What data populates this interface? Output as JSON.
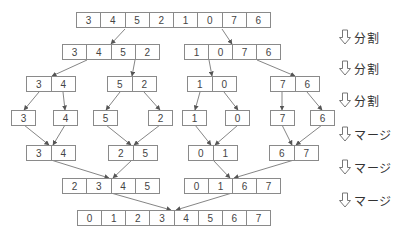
{
  "diagram": {
    "type": "merge-sort",
    "colors": {
      "border": "#8a8a8a",
      "text": "#444444",
      "label": "#333333",
      "arrow": "#666666"
    },
    "rows": [
      {
        "step": "input",
        "arrays": [
          {
            "id": "r0a",
            "x": 76,
            "y": 12,
            "w": 195,
            "values": [
              "3",
              "4",
              "5",
              "2",
              "1",
              "0",
              "7",
              "6"
            ]
          }
        ]
      },
      {
        "step": "split-1",
        "arrays": [
          {
            "id": "r1a",
            "x": 62,
            "y": 44,
            "w": 98,
            "values": [
              "3",
              "4",
              "5",
              "2"
            ]
          },
          {
            "id": "r1b",
            "x": 184,
            "y": 44,
            "w": 97,
            "values": [
              "1",
              "0",
              "7",
              "6"
            ]
          }
        ]
      },
      {
        "step": "split-2",
        "arrays": [
          {
            "id": "r2a",
            "x": 26,
            "y": 76,
            "w": 50,
            "values": [
              "3",
              "4"
            ]
          },
          {
            "id": "r2b",
            "x": 107,
            "y": 76,
            "w": 50,
            "values": [
              "5",
              "2"
            ]
          },
          {
            "id": "r2c",
            "x": 187,
            "y": 76,
            "w": 50,
            "values": [
              "1",
              "0"
            ]
          },
          {
            "id": "r2d",
            "x": 270,
            "y": 76,
            "w": 50,
            "values": [
              "7",
              "6"
            ]
          }
        ]
      },
      {
        "step": "split-3",
        "arrays": [
          {
            "id": "r3a",
            "x": 11,
            "y": 110,
            "w": 25,
            "values": [
              "3"
            ]
          },
          {
            "id": "r3b",
            "x": 53,
            "y": 110,
            "w": 25,
            "values": [
              "4"
            ]
          },
          {
            "id": "r3c",
            "x": 93,
            "y": 110,
            "w": 25,
            "values": [
              "5"
            ]
          },
          {
            "id": "r3d",
            "x": 148,
            "y": 110,
            "w": 25,
            "values": [
              "2"
            ]
          },
          {
            "id": "r3e",
            "x": 182,
            "y": 110,
            "w": 25,
            "values": [
              "1"
            ]
          },
          {
            "id": "r3f",
            "x": 225,
            "y": 110,
            "w": 25,
            "values": [
              "0"
            ]
          },
          {
            "id": "r3g",
            "x": 270,
            "y": 110,
            "w": 25,
            "values": [
              "7"
            ]
          },
          {
            "id": "r3h",
            "x": 310,
            "y": 110,
            "w": 25,
            "values": [
              "6"
            ]
          }
        ]
      },
      {
        "step": "merge-1",
        "arrays": [
          {
            "id": "r4a",
            "x": 26,
            "y": 145,
            "w": 50,
            "values": [
              "3",
              "4"
            ]
          },
          {
            "id": "r4b",
            "x": 108,
            "y": 145,
            "w": 50,
            "values": [
              "2",
              "5"
            ]
          },
          {
            "id": "r4c",
            "x": 188,
            "y": 145,
            "w": 50,
            "values": [
              "0",
              "1"
            ]
          },
          {
            "id": "r4d",
            "x": 269,
            "y": 145,
            "w": 50,
            "values": [
              "6",
              "7"
            ]
          }
        ]
      },
      {
        "step": "merge-2",
        "arrays": [
          {
            "id": "r5a",
            "x": 62,
            "y": 178,
            "w": 98,
            "values": [
              "2",
              "3",
              "4",
              "5"
            ]
          },
          {
            "id": "r5b",
            "x": 184,
            "y": 178,
            "w": 97,
            "values": [
              "0",
              "1",
              "6",
              "7"
            ]
          }
        ]
      },
      {
        "step": "merge-3",
        "arrays": [
          {
            "id": "r6a",
            "x": 77,
            "y": 210,
            "w": 194,
            "values": [
              "0",
              "1",
              "2",
              "3",
              "4",
              "5",
              "6",
              "7"
            ]
          }
        ]
      }
    ],
    "edges": [
      [
        125,
        29,
        111,
        44
      ],
      [
        222,
        29,
        232,
        44
      ],
      [
        87,
        60,
        52,
        76
      ],
      [
        135,
        60,
        132,
        76
      ],
      [
        209,
        60,
        212,
        76
      ],
      [
        257,
        60,
        295,
        76
      ],
      [
        39,
        92,
        24,
        110
      ],
      [
        63,
        92,
        65,
        110
      ],
      [
        120,
        92,
        106,
        110
      ],
      [
        144,
        92,
        160,
        110
      ],
      [
        200,
        92,
        195,
        110
      ],
      [
        224,
        92,
        238,
        110
      ],
      [
        282,
        92,
        282,
        110
      ],
      [
        307,
        92,
        322,
        110
      ],
      [
        24,
        125,
        49,
        145
      ],
      [
        65,
        125,
        53,
        145
      ],
      [
        106,
        125,
        131,
        145
      ],
      [
        160,
        125,
        134,
        145
      ],
      [
        195,
        125,
        211,
        145
      ],
      [
        238,
        125,
        215,
        145
      ],
      [
        282,
        125,
        292,
        145
      ],
      [
        322,
        125,
        296,
        145
      ],
      [
        51,
        160,
        109,
        178
      ],
      [
        132,
        160,
        113,
        178
      ],
      [
        213,
        160,
        230,
        178
      ],
      [
        294,
        160,
        234,
        178
      ],
      [
        111,
        193,
        171,
        210
      ],
      [
        232,
        193,
        176,
        210
      ]
    ],
    "step_labels": [
      {
        "icon": "hollow-down-arrow",
        "text": "分割",
        "y": 29
      },
      {
        "icon": "hollow-down-arrow",
        "text": "分割",
        "y": 60
      },
      {
        "icon": "hollow-down-arrow",
        "text": "分割",
        "y": 92
      },
      {
        "icon": "hollow-down-arrow",
        "text": "マージ",
        "y": 126
      },
      {
        "icon": "hollow-down-arrow",
        "text": "マージ",
        "y": 159
      },
      {
        "icon": "hollow-down-arrow",
        "text": "マージ",
        "y": 192
      }
    ]
  }
}
